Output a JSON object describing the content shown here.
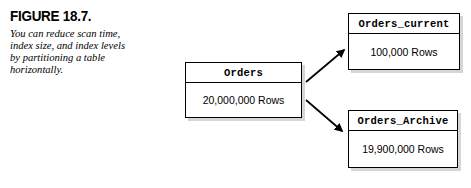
{
  "figure": {
    "label": "FIGURE 18.7.",
    "caption_lines": [
      "You can reduce scan time,",
      "index size, and index levels",
      "by partitioning a table",
      "horizontally."
    ]
  },
  "diagram": {
    "type": "partitioning-diagram",
    "source_table": {
      "name": "Orders",
      "rows_label": "20,000,000 Rows"
    },
    "partitions": [
      {
        "name": "Orders_current",
        "rows_label": "100,000 Rows"
      },
      {
        "name": "Orders_Archive",
        "rows_label": "19,900,000 Rows"
      }
    ],
    "connectors": [
      {
        "name": "arrow-to-orders-current",
        "direction": "up-right"
      },
      {
        "name": "arrow-to-orders-archive",
        "direction": "down-right"
      }
    ]
  },
  "colors": {
    "background": "#ffffff",
    "ink": "#000000",
    "shadow": "#787878"
  }
}
